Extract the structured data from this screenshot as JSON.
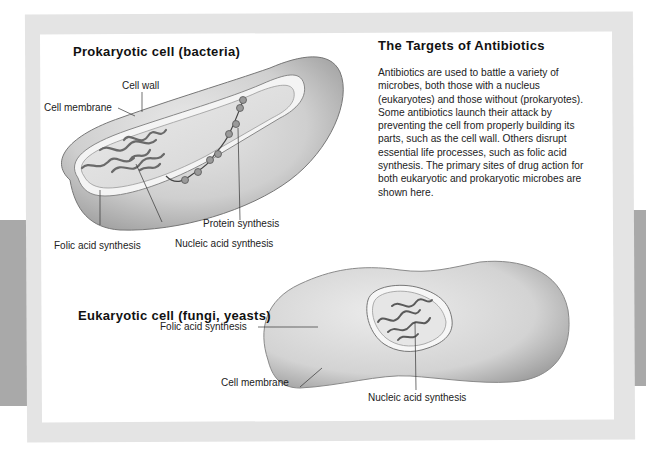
{
  "figure": {
    "heading": "The Targets of Antibiotics",
    "body": "Antibiotics are used to battle a variety of microbes, both those with a nucleus (eukaryotes) and those without (prokaryotes). Some antibiotics launch their attack by preventing the cell from properly building its parts, such as the cell wall. Others disrupt essential life processes, such as folic acid synthesis. The primary sites of drug action for both eukaryotic and prokaryotic microbes are shown here."
  },
  "prokaryote": {
    "title": "Prokaryotic cell (bacteria)",
    "labels": {
      "cell_wall": "Cell wall",
      "cell_membrane": "Cell membrane",
      "protein_synthesis": "Protein synthesis",
      "folic_acid": "Folic acid synthesis",
      "nucleic_acid": "Nucleic acid synthesis"
    }
  },
  "eukaryote": {
    "title": "Eukaryotic cell (fungi, yeasts)",
    "labels": {
      "folic_acid": "Folic acid synthesis",
      "cell_membrane": "Cell membrane",
      "nucleic_acid": "Nucleic acid synthesis"
    }
  },
  "colors": {
    "frame": "#e4e4e4",
    "side_tabs": "#a9a9a9",
    "cell_fill": "#d0d0d0",
    "cytoplasm": "#e2e2e2"
  }
}
